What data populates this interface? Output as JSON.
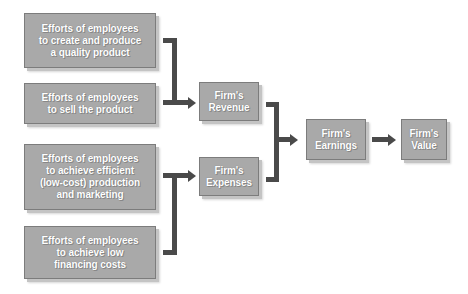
{
  "diagram": {
    "nodes": [
      {
        "id": "effort-quality",
        "label": "Efforts of employees\nto create and produce\na quality product"
      },
      {
        "id": "effort-sell",
        "label": "Efforts of employees\nto sell the product"
      },
      {
        "id": "effort-efficient",
        "label": "Efforts of employees\nto achieve efficient\n(low-cost) production\nand marketing"
      },
      {
        "id": "effort-financing",
        "label": "Efforts of employees\nto achieve low\nfinancing costs"
      },
      {
        "id": "revenue",
        "label": "Firm's\nRevenue"
      },
      {
        "id": "expenses",
        "label": "Firm's\nExpenses"
      },
      {
        "id": "earnings",
        "label": "Firm's\nEarnings"
      },
      {
        "id": "value",
        "label": "Firm's\nValue"
      }
    ],
    "edges": [
      {
        "from": [
          "effort-quality",
          "effort-sell"
        ],
        "to": "revenue"
      },
      {
        "from": [
          "effort-efficient",
          "effort-financing"
        ],
        "to": "expenses"
      },
      {
        "from": [
          "revenue",
          "expenses"
        ],
        "to": "earnings"
      },
      {
        "from": [
          "earnings"
        ],
        "to": "value"
      }
    ],
    "colors": {
      "box_fill": "#a9a9a9",
      "box_border": "#7c7c7c",
      "connector": "#4a4a4a",
      "text": "#ffffff"
    }
  }
}
